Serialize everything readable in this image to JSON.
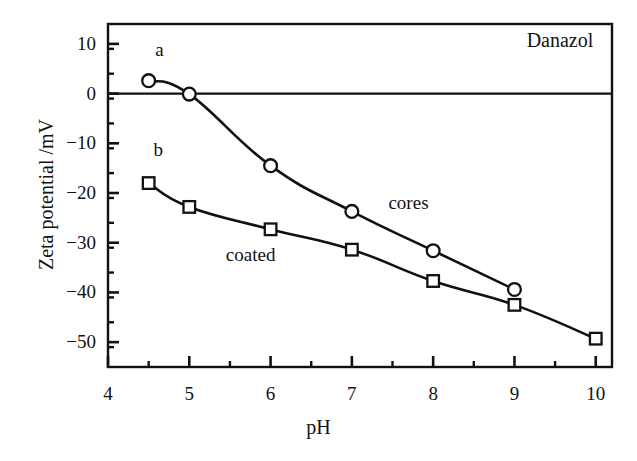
{
  "chart_data": {
    "type": "line",
    "title": "Danazol",
    "xlabel": "pH",
    "ylabel": "Zeta potential /mV",
    "xlim": [
      4,
      10.2
    ],
    "ylim": [
      -55,
      14
    ],
    "xticks": [
      4,
      5,
      6,
      7,
      8,
      9,
      10
    ],
    "xtick_labels": [
      "4",
      "5",
      "6",
      "7",
      "8",
      "9",
      "10"
    ],
    "xminor_step": 0.5,
    "yticks": [
      10,
      0,
      -10,
      -20,
      -30,
      -40,
      -50
    ],
    "ytick_labels": [
      "10",
      "0",
      "−10",
      "−20",
      "−30",
      "−40",
      "−50"
    ],
    "yminor_step": 5,
    "grid": false,
    "legend_position": "inline-annotations",
    "zero_line": 0,
    "series": [
      {
        "name": "cores",
        "curve_label": "a",
        "marker": "open-circle",
        "x": [
          4.5,
          5.0,
          6.0,
          7.0,
          8.0,
          9.0
        ],
        "y": [
          2.6,
          -0.1,
          -14.5,
          -23.7,
          -31.6,
          -39.4
        ]
      },
      {
        "name": "coated",
        "curve_label": "b",
        "marker": "open-square",
        "x": [
          4.5,
          5.0,
          6.0,
          7.0,
          8.0,
          9.0,
          10.0
        ],
        "y": [
          -18.0,
          -22.8,
          -27.3,
          -31.4,
          -37.7,
          -42.5,
          -49.3
        ]
      }
    ],
    "annotations": [
      {
        "text": "a",
        "x": 4.58,
        "y": 8.6
      },
      {
        "text": "b",
        "x": 4.56,
        "y": -11.5
      },
      {
        "text": "cores",
        "x": 7.45,
        "y": -22.2
      },
      {
        "text": "coated",
        "x": 5.45,
        "y": -32.6
      },
      {
        "text": "Danazol",
        "x": 9.15,
        "y": 10.6
      }
    ],
    "colors": {
      "line": "#111111",
      "marker_face": "#ffffff",
      "marker_edge": "#111111",
      "axis": "#111111",
      "background": "#ffffff"
    }
  },
  "axis_labels": {
    "x_title": "pH",
    "y_title": "Zeta potential /mV"
  },
  "corner_title": "Danazol"
}
